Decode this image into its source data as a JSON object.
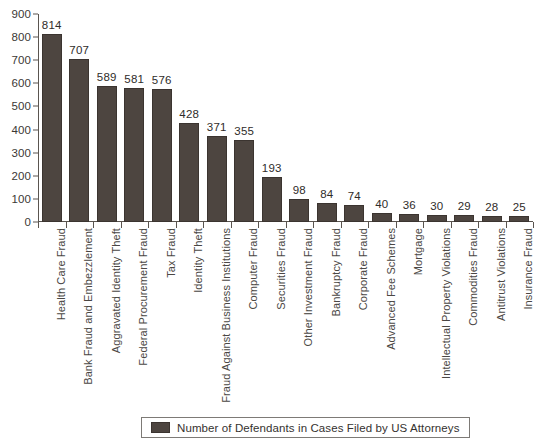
{
  "chart_data": {
    "type": "bar",
    "title": "",
    "subtitle": "",
    "xlabel": "",
    "ylabel": "",
    "ylim": [
      0,
      900
    ],
    "ytick_step": 100,
    "yticks": [
      900,
      800,
      700,
      600,
      500,
      400,
      300,
      200,
      100,
      0
    ],
    "grid": false,
    "legend_position": "bottom",
    "orientation": "vertical",
    "bar_color": "#4d4540",
    "show_value_labels": true,
    "categories": [
      "Health Care Fraud",
      "Bank Fraud and Embezzlement",
      "Aggravated Identity Theft",
      "Federal Procurement Fraud",
      "Tax Fraud",
      "Identity Theft",
      "Fraud Against Business Institutions",
      "Computer Fraud",
      "Securities Fraud",
      "Other Investment Fraud",
      "Bankruptcy Fraud",
      "Corporate Fraud",
      "Advanced Fee Schemes",
      "Mortgage",
      "Intellectual Property Violations",
      "Commodities Fraud",
      "Antitrust Violations",
      "Insurance Fraud"
    ],
    "series": [
      {
        "name": "Number of Defendants in Cases Filed by US Attorneys",
        "values": [
          814,
          707,
          589,
          581,
          576,
          428,
          371,
          355,
          193,
          98,
          84,
          74,
          40,
          36,
          30,
          29,
          28,
          25
        ]
      }
    ],
    "values": [
      814,
      707,
      589,
      581,
      576,
      428,
      371,
      355,
      193,
      98,
      84,
      74,
      40,
      36,
      30,
      29,
      28,
      25
    ]
  },
  "legend": {
    "entries": [
      {
        "label": "Number of Defendants in Cases Filed by US Attorneys",
        "color": "#4d4540"
      }
    ]
  },
  "colors": {
    "bar": "#4d4540",
    "axis": "#5a5550",
    "text": "#3a3a3a",
    "background": "#ffffff"
  }
}
